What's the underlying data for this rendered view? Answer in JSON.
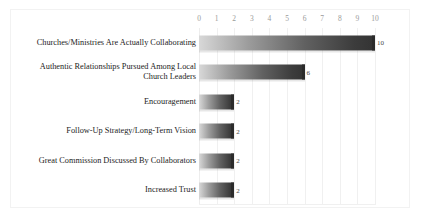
{
  "chart_data": {
    "type": "bar",
    "orientation": "horizontal",
    "title": "",
    "xlabel": "",
    "ylabel": "",
    "xlim": [
      0,
      10
    ],
    "grid": true,
    "legend": false,
    "x_ticks": [
      "0",
      "1",
      "2",
      "3",
      "4",
      "5",
      "6",
      "7",
      "8",
      "9",
      "10"
    ],
    "categories": [
      "Churches/Ministries Are Actually Collaborating",
      "Authentic Relationships Pursued Among Local Church Leaders",
      "Encouragement",
      "Follow-Up Strategy/Long-Term Vision",
      "Great Commission Discussed By Collaborators",
      "Increased Trust"
    ],
    "values": [
      10,
      6,
      2,
      2,
      2,
      2
    ],
    "data_labels": [
      "10",
      "6",
      "2",
      "2",
      "2",
      "2"
    ]
  },
  "style": {
    "bar_light": "#d8d8d8",
    "bar_dark": "#333333",
    "gridline": "#f0f0f0",
    "tick_text": "#9a9a9a",
    "label_text": "#1c1c1c",
    "background": "#ffffff"
  }
}
